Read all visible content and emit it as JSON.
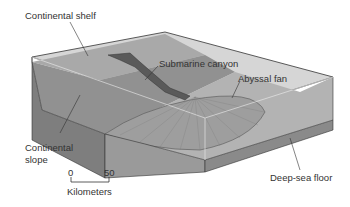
{
  "diagram": {
    "type": "block diagram of continental margin",
    "labels": {
      "continental_shelf": "Continental shelf",
      "submarine_canyon": "Submarine canyon",
      "abyssal_fan": "Abyssal fan",
      "continental_slope_1": "Continental",
      "continental_slope_2": "slope",
      "deep_sea_floor": "Deep-sea floor"
    },
    "scale": {
      "start": "0",
      "end": "50",
      "unit": "Kilometers"
    },
    "colors": {
      "shelf": "#a8a8a8",
      "slope": "#8e8e8e",
      "floor": "#b0b0b0",
      "top_plane": "#d4d4d4",
      "side_dark": "#7a7a7a",
      "canyon": "#555555",
      "fan": "#9c9c9c",
      "label_text": "#333333"
    }
  }
}
